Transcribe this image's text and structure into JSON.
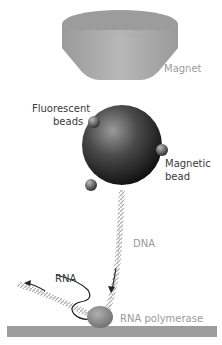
{
  "diagram": {
    "labels": {
      "magnet": "Magnet",
      "fluorescent_beads_line1": "Fluorescent",
      "fluorescent_beads_line2": "beads",
      "magnetic_bead_line1": "Magnetic",
      "magnetic_bead_line2": "bead",
      "dna": "DNA",
      "rna": "RNA",
      "rna_polymerase": "RNA polymerase"
    },
    "colors": {
      "magnet": "#a8a8a8",
      "bead": "#3c3c3c",
      "surface": "#9c9c9c",
      "polymerase": "#8a8a8a",
      "label_dark": "#3a3a3a",
      "label_grey": "#9a9a9a"
    }
  }
}
